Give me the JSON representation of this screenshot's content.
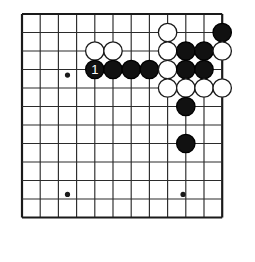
{
  "figure": {
    "kind": "go-board-diagram",
    "board": {
      "columns": 12,
      "rows": 12,
      "origin_x": 22,
      "origin_y": 14,
      "spacing_x": 18.2,
      "spacing_y": 18.5,
      "line_color": "#2b2b2b",
      "edge_color": "#1a1a1a",
      "line_width": 1.15,
      "edge_width": 2.2,
      "background_color": "#ffffff"
    },
    "star_points": [
      {
        "name": "star-point-left",
        "col": 2.5,
        "row": 3.3
      },
      {
        "name": "star-point-bottom-left",
        "col": 2.5,
        "row": 9.75
      },
      {
        "name": "star-point-bottom-right",
        "col": 8.85,
        "row": 9.75
      }
    ],
    "stone_style": {
      "radius": 9.2,
      "black_fill": "#111111",
      "black_stroke": "#000000",
      "white_fill": "#ffffff",
      "white_stroke": "#1a1a1a",
      "stroke_width": 1.3,
      "label_color": "#ffffff"
    },
    "stones": [
      {
        "name": "white-stone-c8r1",
        "color": "white",
        "col": 8,
        "row": 1,
        "label": ""
      },
      {
        "name": "black-stone-c11r1",
        "color": "black",
        "col": 11,
        "row": 1,
        "label": ""
      },
      {
        "name": "white-stone-c4r2",
        "color": "white",
        "col": 4,
        "row": 2,
        "label": ""
      },
      {
        "name": "white-stone-c5r2",
        "color": "white",
        "col": 5,
        "row": 2,
        "label": ""
      },
      {
        "name": "white-stone-c8r2",
        "color": "white",
        "col": 8,
        "row": 2,
        "label": ""
      },
      {
        "name": "black-stone-c9r2",
        "color": "black",
        "col": 9,
        "row": 2,
        "label": ""
      },
      {
        "name": "black-stone-c10r2",
        "color": "black",
        "col": 10,
        "row": 2,
        "label": ""
      },
      {
        "name": "white-stone-c11r2",
        "color": "white",
        "col": 11,
        "row": 2,
        "label": ""
      },
      {
        "name": "black-stone-move-1",
        "color": "black",
        "col": 4,
        "row": 3,
        "label": "1"
      },
      {
        "name": "black-stone-c5r3",
        "color": "black",
        "col": 5,
        "row": 3,
        "label": ""
      },
      {
        "name": "black-stone-c6r3",
        "color": "black",
        "col": 6,
        "row": 3,
        "label": ""
      },
      {
        "name": "black-stone-c7r3",
        "color": "black",
        "col": 7,
        "row": 3,
        "label": ""
      },
      {
        "name": "white-stone-c8r3",
        "color": "white",
        "col": 8,
        "row": 3,
        "label": ""
      },
      {
        "name": "black-stone-c9r3",
        "color": "black",
        "col": 9,
        "row": 3,
        "label": ""
      },
      {
        "name": "black-stone-c10r3",
        "color": "black",
        "col": 10,
        "row": 3,
        "label": ""
      },
      {
        "name": "white-stone-c8r4",
        "color": "white",
        "col": 8,
        "row": 4,
        "label": ""
      },
      {
        "name": "white-stone-c9r4",
        "color": "white",
        "col": 9,
        "row": 4,
        "label": ""
      },
      {
        "name": "white-stone-c10r4",
        "color": "white",
        "col": 10,
        "row": 4,
        "label": ""
      },
      {
        "name": "white-stone-c11r4",
        "color": "white",
        "col": 11,
        "row": 4,
        "label": ""
      },
      {
        "name": "black-stone-c9r5",
        "color": "black",
        "col": 9,
        "row": 5,
        "label": ""
      },
      {
        "name": "black-stone-c9r7",
        "color": "black",
        "col": 9,
        "row": 7,
        "label": ""
      }
    ]
  }
}
